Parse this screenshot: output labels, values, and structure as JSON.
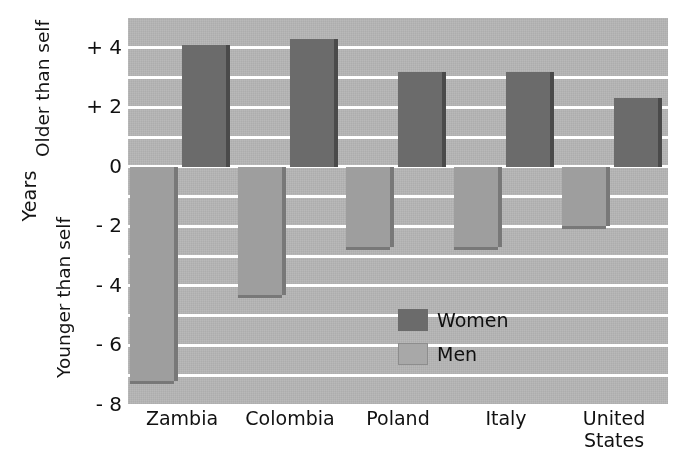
{
  "chart_data": {
    "type": "bar",
    "title": "",
    "subtitle": "",
    "xlabel": "",
    "ylabel": "Years",
    "ylabel_upper": "Older than self",
    "ylabel_lower": "Younger than self",
    "categories": [
      "Zambia",
      "Colombia",
      "Poland",
      "Italy",
      "United States"
    ],
    "category_lines": [
      [
        "Zambia"
      ],
      [
        "Colombia"
      ],
      [
        "Poland"
      ],
      [
        "Italy"
      ],
      [
        "United",
        "States"
      ]
    ],
    "series": [
      {
        "name": "Women",
        "color": "#6b6b6b",
        "values": [
          4.1,
          4.3,
          3.2,
          3.2,
          2.3
        ]
      },
      {
        "name": "Men",
        "color": "#a8a8a8",
        "values": [
          -7.2,
          -4.3,
          -2.7,
          -2.7,
          -2.0
        ]
      }
    ],
    "ylim": [
      -8,
      5
    ],
    "ytick_values": [
      4,
      2,
      0,
      -2,
      -4,
      -6,
      -8
    ],
    "ytick_labels": [
      "+ 4",
      "+ 2",
      "0",
      "- 2",
      "- 4",
      "- 6",
      "- 8"
    ],
    "gridline_values": [
      5,
      4,
      3,
      2,
      1,
      0,
      -1,
      -2,
      -3,
      -4,
      -5,
      -6,
      -7,
      -8
    ],
    "grid": true,
    "legend_position": "inside-lower-right",
    "legend_entries": [
      {
        "label": "Women",
        "swatch": "women"
      },
      {
        "label": "Men",
        "swatch": "men"
      }
    ],
    "plot_background": "#b3b3b3",
    "gridline_color": "#ffffff"
  }
}
